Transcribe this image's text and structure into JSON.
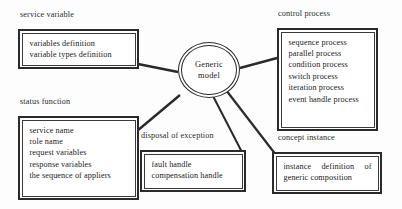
{
  "figure": {
    "type": "concept-diagram",
    "center_node": {
      "line1": "Generic",
      "line2": "model"
    },
    "groups": [
      {
        "key": "service-variable",
        "caption": "service variable",
        "items": [
          "variables definition",
          "variable types definition"
        ]
      },
      {
        "key": "status-function",
        "caption": "status function",
        "items": [
          "service name",
          "role name",
          "request variables",
          "response variables",
          "the sequence of appliers"
        ]
      },
      {
        "key": "disposal-of-exception",
        "caption": "disposal of exception",
        "items": [
          "fault handle",
          "compensation handle"
        ]
      },
      {
        "key": "control-process",
        "caption": "control process",
        "items": [
          "sequence process",
          "parallel process",
          "condition process",
          "switch process",
          "iteration process",
          "event handle process"
        ]
      },
      {
        "key": "concept-instance",
        "caption": "concept instance",
        "items": [
          "instance definition of",
          "generic composition"
        ]
      }
    ],
    "colors": {
      "line": "#2a2a2a",
      "text": "#222222",
      "background": "#fdfdfd"
    }
  }
}
